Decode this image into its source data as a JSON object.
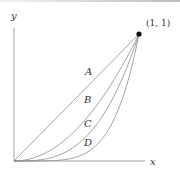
{
  "diagram": {
    "axes": {
      "x_label": "x",
      "y_label": "y"
    },
    "point": {
      "label": "(1, 1)",
      "x": 1,
      "y": 1
    },
    "curves": [
      {
        "label": "A",
        "exponent": 1
      },
      {
        "label": "B",
        "exponent": 2
      },
      {
        "label": "C",
        "exponent": 3
      },
      {
        "label": "D",
        "exponent": 5
      }
    ],
    "colors": {
      "curve": "#8c8c8c",
      "axis": "#8c8c8c",
      "point": "#111111",
      "text": "#333333"
    }
  }
}
